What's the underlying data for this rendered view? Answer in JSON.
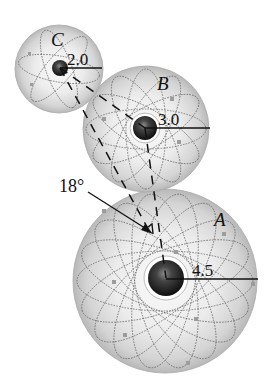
{
  "diagram": {
    "type": "three charged spheres with nuclei and orbit patterns",
    "spheres": [
      {
        "id": "C",
        "label": "C",
        "radius_label": "2.0",
        "cx": 59,
        "cy": 69,
        "r": 44,
        "nucleus_r": 8
      },
      {
        "id": "B",
        "label": "B",
        "radius_label": "3.0",
        "cx": 146,
        "cy": 129,
        "r": 63,
        "nucleus_r": 12
      },
      {
        "id": "A",
        "label": "A",
        "radius_label": "4.5",
        "cx": 165,
        "cy": 281,
        "r": 92,
        "nucleus_r": 18
      }
    ],
    "angle_label": "18°",
    "colors": {
      "sphere_edge": "#9a9a9a",
      "sphere_light": "#f4f4f4",
      "sphere_mid": "#d2d2d2",
      "nucleus_dark": "#1c1c1c",
      "orbit": "#555555",
      "line": "#111111"
    }
  }
}
